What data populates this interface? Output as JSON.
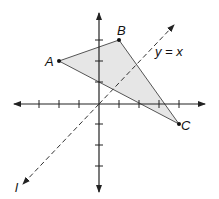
{
  "diagram": {
    "type": "coordinate-plane-triangle",
    "points": {
      "A": {
        "label": "A",
        "x": -2,
        "y": 2
      },
      "B": {
        "label": "B",
        "x": 1,
        "y": 3
      },
      "C": {
        "label": "C",
        "x": 4,
        "y": -1
      }
    },
    "line_label": "y = x",
    "reflection_line_label": "l",
    "colors": {
      "fill": "#e6e6e6",
      "stroke": "#444444",
      "axis": "#222222"
    }
  }
}
